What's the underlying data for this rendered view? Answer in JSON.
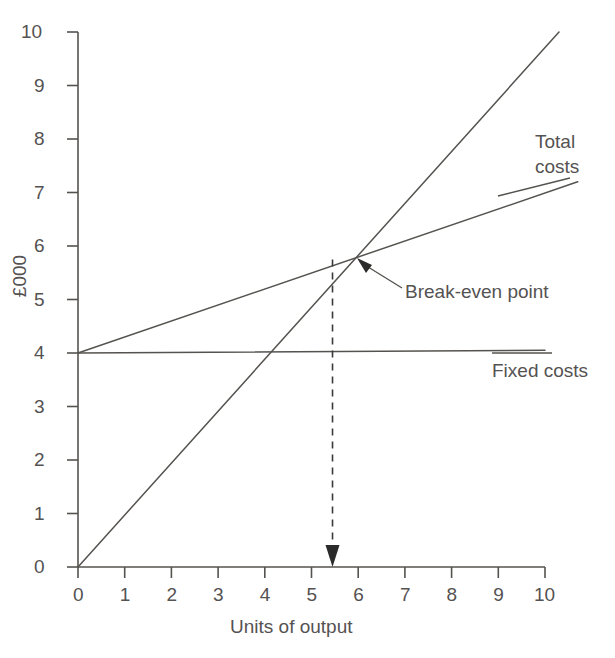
{
  "chart_data": {
    "type": "line",
    "title": "",
    "xlabel": "Units of output",
    "ylabel": "£000",
    "xlim": [
      0,
      10
    ],
    "ylim": [
      0,
      10
    ],
    "xticks": [
      "0",
      "1",
      "2",
      "3",
      "4",
      "5",
      "6",
      "7",
      "8",
      "9",
      "10"
    ],
    "yticks": [
      "0",
      "1",
      "2",
      "3",
      "4",
      "5",
      "6",
      "7",
      "8",
      "9",
      "10"
    ],
    "grid": false,
    "legend_position": "inline-right",
    "series": [
      {
        "name": "Sales revenue",
        "label": "",
        "x": [
          0,
          10.3
        ],
        "y": [
          0,
          10.0
        ]
      },
      {
        "name": "Total costs",
        "label": "Total costs",
        "label_line1": "Total",
        "label_line2": "costs",
        "x": [
          0,
          10.7
        ],
        "y": [
          4.0,
          7.2
        ]
      },
      {
        "name": "Fixed costs",
        "label": "Fixed costs",
        "x": [
          0,
          10.0
        ],
        "y": [
          4.0,
          4.05
        ]
      }
    ],
    "annotations": [
      {
        "name": "break-even-point",
        "text": "Break-even point",
        "x": 5.45,
        "y": 5.75
      }
    ],
    "dropline": {
      "name": "break-even-dropline",
      "x": 5.45,
      "y_from": 5.75,
      "y_to": 0,
      "style": "dashed",
      "arrow": "down"
    }
  },
  "axis": {
    "x_title": "Units of output",
    "y_title": "£000"
  },
  "colors": {
    "line": "#55534f",
    "text": "#555252",
    "axis": "#55534f",
    "background": "#ffffff"
  }
}
